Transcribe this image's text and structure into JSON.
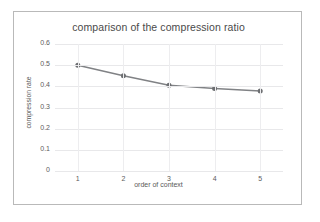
{
  "chart_data": {
    "type": "line",
    "title": "comparison of the compression ratio",
    "xlabel": "order of context",
    "ylabel": "compression rate",
    "categories": [
      1,
      2,
      3,
      4,
      5
    ],
    "x": [
      1,
      2,
      3,
      4,
      5
    ],
    "values": [
      0.5,
      0.45,
      0.405,
      0.39,
      0.378
    ],
    "series": [
      {
        "name": "compression rate",
        "values": [
          0.5,
          0.45,
          0.405,
          0.39,
          0.378
        ]
      }
    ],
    "x_tick_labels": [
      "1",
      "2",
      "3",
      "4",
      "5"
    ],
    "y_tick_labels": [
      "0",
      "0.1",
      "0.2",
      "0.3",
      "0.4",
      "0.5",
      "0.6"
    ],
    "y_ticks": [
      0,
      0.1,
      0.2,
      0.3,
      0.4,
      0.5,
      0.6
    ],
    "ylim": [
      0,
      0.6
    ],
    "xlim": [
      0.5,
      5.5
    ],
    "grid": true,
    "legend": "none",
    "line_color": "#808285",
    "marker_color": "#6d6f72",
    "marker": "circle"
  },
  "figure": {
    "title": "comparison of the compression ratio",
    "x_axis_title": "order of context",
    "y_axis_title": "compression rate"
  }
}
